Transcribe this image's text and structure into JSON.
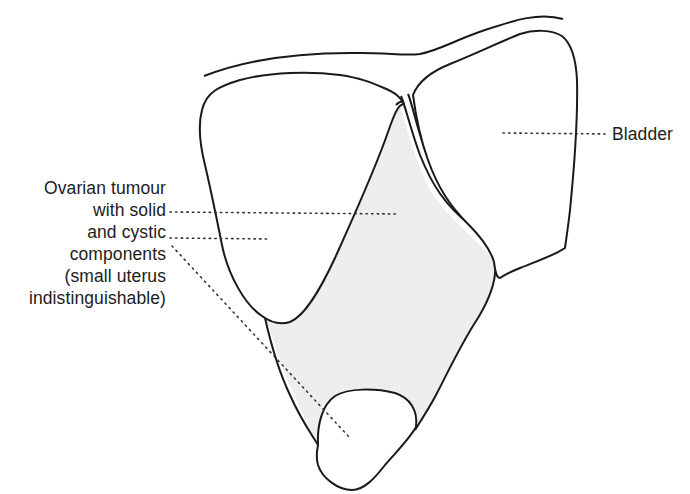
{
  "figure": {
    "type": "anatomical line diagram",
    "labels": {
      "tumour_lines": [
        "Ovarian tumour",
        "with solid",
        "and cystic",
        "components",
        "(small uterus",
        "indistinguishable)"
      ],
      "bladder": "Bladder"
    },
    "structures": [
      {
        "name": "abdominal-wall",
        "style": "outline"
      },
      {
        "name": "cystic-component-upper",
        "style": "outline"
      },
      {
        "name": "solid-component",
        "style": "stippled",
        "fill": "#eeeeee"
      },
      {
        "name": "cystic-component-lower",
        "style": "outline"
      },
      {
        "name": "bladder",
        "style": "outline"
      }
    ],
    "colors": {
      "line": "#1a1a1a",
      "shading": "#ededed",
      "background": "#ffffff"
    }
  }
}
